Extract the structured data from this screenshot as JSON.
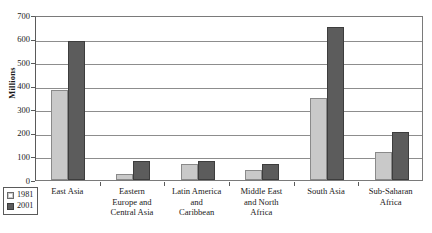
{
  "chart_data": {
    "type": "bar",
    "title": "",
    "xlabel": "",
    "ylabel": "Millions",
    "ylim": [
      0,
      700
    ],
    "ytick_step": 100,
    "yticks": [
      "700",
      "600",
      "500",
      "400",
      "300",
      "200",
      "100",
      "0"
    ],
    "grid": true,
    "legend_position": "bottom-left",
    "categories": [
      "East Asia",
      "Eastern Europe and Central Asia",
      "Latin America and Caribbean",
      "Middle East and North Africa",
      "South Asia",
      "Sub-Saharan Africa"
    ],
    "category_label_lines": [
      [
        "East Asia"
      ],
      [
        "Eastern",
        "Europe and",
        "Central Asia"
      ],
      [
        "Latin America",
        "and",
        "Caribbean"
      ],
      [
        "Middle East",
        "and North",
        "Africa"
      ],
      [
        "South Asia"
      ],
      [
        "Sub-Saharan",
        "Africa"
      ]
    ],
    "series": [
      {
        "name": "1981",
        "color": "#c9c9c9",
        "values": [
          380,
          25,
          70,
          43,
          348,
          120
        ]
      },
      {
        "name": "2001",
        "color": "#5c5c5c",
        "values": [
          590,
          80,
          80,
          68,
          650,
          205
        ]
      }
    ]
  },
  "legend": {
    "entries": [
      {
        "label": "1981"
      },
      {
        "label": "2001"
      }
    ]
  },
  "caption": {
    "text": ""
  }
}
